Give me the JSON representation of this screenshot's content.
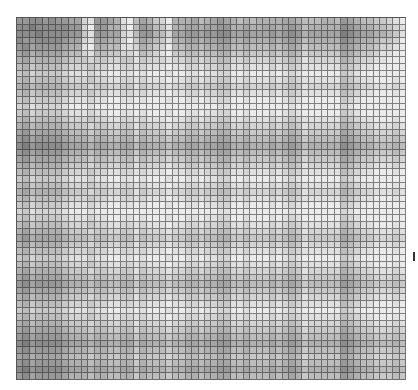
{
  "figure": {
    "kind": "grayscale-cell-matrix",
    "columns": 60,
    "rows": 55,
    "palette": [
      "#ebebeb",
      "#e0e0e0",
      "#d4d4d4",
      "#c8c8c8",
      "#bcbcbc",
      "#b0b0b0",
      "#a4a4a4",
      "#989898",
      "#8c8c8c",
      "#7e7e7e"
    ],
    "grid_line_color": "#2e2e2e",
    "background": "#ffffff",
    "edge_mark_color": "#333333"
  },
  "cells": [
    "778878776621776510465320555645676545455556654445547654433210",
    "889888887720775520476431556656677556556656764555558765544321",
    "888988887731776621477542667767788667666767875666669876655431",
    "877888876621665520365431556656677556555656764555558765543320",
    "786777765510554411254320445545566445444545653444447654432210",
    "675666654421443322143210334434455334333434542333336543321100",
    "564555543332332233132221223323344223222323431222225432211000",
    "453444432223221122121110112212233112111212321111114321100000",
    "342333321112110011010001001101122001000101210000003210000000",
    "453444432223221122121110112212233112111212321111114321100010",
    "564555543332332233132221223323344223222323431222225432211121",
    "453444432223221122121110112212233112111212321111114321100010",
    "342333321112110011010001001101122001000101210000003210000000",
    "231222210001000000000000000000011000000000100000002100000000",
    "342333321112110011010001001101122001000101210000003210000000",
    "453444432223221122121110112212233112111212321111114321100010",
    "564555543332332233132221223323344223222323431222225432211121",
    "675666654443443344243332334434455334333434542333336543322232",
    "786777765554554455354443445545566445444545653444447654433343",
    "897888876665665566465554556656677556555656764555558765544454",
    "786777765554554455354443445545566445444545653444447654433343",
    "675666654443443344243332334434455334333434542333336543322232",
    "564555543332332233132221223323344223222323431222225432211121",
    "453444432223221122121110112212233112111212321111114321100010",
    "342333321112110011010001001101122001000101210000003210000000",
    "453444432223221122121110112212233112111212321111114321100010",
    "564555543332332233132221223323344223222323431222225432211121",
    "453444432223221122121110112212233112111212321111114321100010",
    "342333321112110011010001001101122001000101210000003210000000",
    "231222210001000000000000000000011000000000100000002100000000",
    "342333321112110011010001001101122001000101210000003210000000",
    "453444432223221122121110112212233112111212321111114321100010",
    "564555543332332233132221223323344223222323431222225432211121",
    "675666654443443344243332334434455334333434542333336543322232",
    "564555543332332233132221223323344223222323431222225432211121",
    "453444432223221122121110112212233112111212321111114321100010",
    "342333321112110011010001001101122001000101210000003210000000",
    "453444432223221122121110112212233112111212321111114321100010",
    "564555543332332233132221223323344223222323431222225432211121",
    "675666654443443344243332334434455334333434542333336543322232",
    "786777765554554455354443445545566445444545653444447654433343",
    "675666654443443344243332334434455334333434542333336543322232",
    "564555543332332233132221223323344223222323431222225432211121",
    "453444432223221122121110112212233112111212321111114321100010",
    "342333321112110011010001001101122001000101210000003210000000",
    "453444432223221122121110112212233112111212321111114321100010",
    "564555543332332233132221223323344223222323431222225432211121",
    "675666654443443344243332334434455334333434542333336543322232",
    "786777765554554455354443445545566445444545653444447654433343",
    "897888876665665566465554556656677556555656764555558765544454",
    "786777765554554455354443445545566445444545653444447654433343",
    "675666654443443344243332334434455334333434542333336543322232",
    "786777765554554455354443445545566445444545653444447654433343",
    "897888876665665566465554556656677556555656764555558765544454",
    "786777765554554455354443445545566445444545653444447654433343"
  ]
}
